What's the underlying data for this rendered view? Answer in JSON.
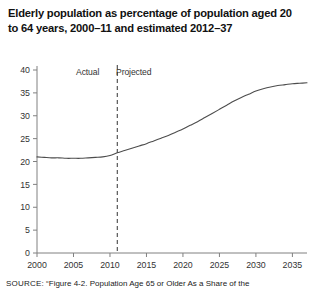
{
  "title": "Elderly population as percentage of population aged 20 to 64 years, 2000–11 and estimated 2012–37",
  "annotations": {
    "actual": "Actual",
    "projected": "Projected"
  },
  "source": {
    "label": "SOURCE:",
    "text": "“Figure 4-2. Population Age 65 or Older As a Share of the"
  },
  "colors": {
    "line": "#4d4d4d",
    "axis": "#808080",
    "divider": "#333333",
    "text": "#222222",
    "background": "#ffffff"
  },
  "chart_data": {
    "type": "line",
    "title": "Elderly population as percentage of population aged 20 to 64 years, 2000–11 and estimated 2012–37",
    "xlabel": "",
    "ylabel": "",
    "xlim": [
      2000,
      2037
    ],
    "ylim": [
      0,
      40
    ],
    "grid": false,
    "legend": null,
    "yticks": [
      0,
      5,
      10,
      15,
      20,
      25,
      30,
      35,
      40
    ],
    "xticks": [
      2000,
      2005,
      2010,
      2015,
      2020,
      2025,
      2030,
      2035
    ],
    "xtick_labels": [
      "2000",
      "2005",
      "2010",
      "2015",
      "2020",
      "2025",
      "2030",
      "2035"
    ],
    "ytick_labels": [
      "0",
      "5",
      "10",
      "15",
      "20",
      "25",
      "30",
      "35",
      "40"
    ],
    "divider_x": 2011,
    "divider_style": "dashed",
    "annotations": [
      {
        "text": "Actual",
        "x": 2007,
        "y": 39
      },
      {
        "text": "Projected",
        "x": 2015,
        "y": 39
      }
    ],
    "series": [
      {
        "name": "Elderly population as percentage of population aged 20 to 64",
        "x": [
          2000,
          2001,
          2002,
          2003,
          2004,
          2005,
          2006,
          2007,
          2008,
          2009,
          2010,
          2011,
          2012,
          2013,
          2014,
          2015,
          2016,
          2017,
          2018,
          2019,
          2020,
          2021,
          2022,
          2023,
          2024,
          2025,
          2026,
          2027,
          2028,
          2029,
          2030,
          2031,
          2032,
          2033,
          2034,
          2035,
          2036,
          2037
        ],
        "values": [
          21.0,
          20.9,
          20.8,
          20.8,
          20.7,
          20.7,
          20.7,
          20.8,
          20.9,
          21.0,
          21.3,
          21.9,
          22.4,
          22.9,
          23.4,
          23.9,
          24.5,
          25.1,
          25.7,
          26.4,
          27.1,
          27.9,
          28.7,
          29.6,
          30.5,
          31.4,
          32.3,
          33.2,
          34.0,
          34.7,
          35.4,
          35.9,
          36.3,
          36.6,
          36.8,
          37.0,
          37.1,
          37.2
        ]
      }
    ]
  }
}
